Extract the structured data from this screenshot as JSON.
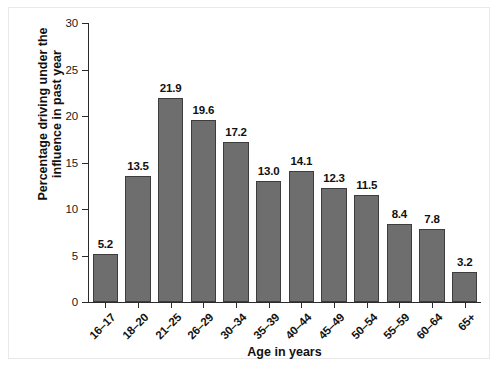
{
  "figure": {
    "background_color": "#ffffff",
    "frame_color": "#e9e9e9",
    "bar_fill_color": "#6e6e6e",
    "bar_edge_color": "#3d3d3d",
    "axis_color": "#2b2b2b",
    "text_color": "#111111"
  },
  "chart_data": {
    "type": "bar",
    "title": "",
    "subtitle": "",
    "xlabel": "Age in years",
    "ylabel": "Percentage driving under the influence in past year",
    "ylabel_line1": "Percentage driving under the",
    "ylabel_line2": "influence in past year",
    "categories": [
      "16–17",
      "18–20",
      "21–25",
      "26–29",
      "30–34",
      "35–39",
      "40–44",
      "45–49",
      "50–54",
      "55–59",
      "60–64",
      "65+"
    ],
    "values": [
      5.2,
      13.5,
      21.9,
      19.6,
      17.2,
      13.0,
      14.1,
      12.3,
      11.5,
      8.4,
      7.8,
      3.2
    ],
    "value_labels": [
      "5.2",
      "13.5",
      "21.9",
      "19.6",
      "17.2",
      "13.0",
      "14.1",
      "12.3",
      "11.5",
      "8.4",
      "7.8",
      "3.2"
    ],
    "ylim": [
      0,
      30
    ],
    "yticks": [
      0,
      5,
      10,
      15,
      20,
      25,
      30
    ],
    "ytick_labels": [
      "0",
      "5",
      "10",
      "15",
      "20",
      "25",
      "30"
    ],
    "grid": false,
    "legend": null,
    "legend_position": "none",
    "bar_label_position": "above",
    "xtick_label_rotation": -45
  },
  "artifact": {
    "bottom_strip_text": ""
  }
}
